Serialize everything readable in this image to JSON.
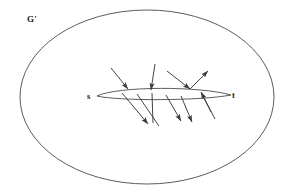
{
  "figure": {
    "title_label": "G'",
    "source_label": "s",
    "sink_label": "t",
    "stroke_color": "#3a3a3a",
    "label_color": "#1a1a1a",
    "background_color": "#ffffff",
    "outer_region": {
      "shape": "ellipse",
      "cx": 147,
      "cy": 97,
      "rx": 127,
      "ry": 87
    },
    "cut_lens": {
      "shape": "lens",
      "left_x": 97,
      "right_x": 231,
      "center_y": 96,
      "top_bulge": 8,
      "bottom_bulge": 3
    },
    "arrows": [
      {
        "name": "in-arrow-1",
        "x1": 111,
        "y1": 68,
        "x2": 128,
        "y2": 89,
        "head": "end"
      },
      {
        "name": "in-arrow-2",
        "x1": 155,
        "y1": 64,
        "x2": 151,
        "y2": 90,
        "head": "end"
      },
      {
        "name": "in-arrow-3",
        "x1": 167,
        "y1": 71,
        "x2": 190,
        "y2": 89,
        "head": "end"
      },
      {
        "name": "out-arrow-1",
        "x1": 190,
        "y1": 89,
        "x2": 208,
        "y2": 71,
        "head": "end"
      },
      {
        "name": "out-arrow-2",
        "x1": 122,
        "y1": 93,
        "x2": 148,
        "y2": 124,
        "head": "end"
      },
      {
        "name": "out-arrow-3",
        "x1": 137,
        "y1": 94,
        "x2": 159,
        "y2": 126,
        "head": "none"
      },
      {
        "name": "out-arrow-4",
        "x1": 152,
        "y1": 93,
        "x2": 153,
        "y2": 123,
        "head": "none"
      },
      {
        "name": "out-arrow-5",
        "x1": 166,
        "y1": 95,
        "x2": 181,
        "y2": 121,
        "head": "end"
      },
      {
        "name": "out-arrow-6",
        "x1": 181,
        "y1": 96,
        "x2": 192,
        "y2": 122,
        "head": "end"
      },
      {
        "name": "in-arrow-4",
        "x1": 211,
        "y1": 112,
        "x2": 201,
        "y2": 92,
        "head": "end"
      },
      {
        "name": "out-arrow-7",
        "x1": 203,
        "y1": 96,
        "x2": 215,
        "y2": 119,
        "head": "none"
      }
    ]
  }
}
